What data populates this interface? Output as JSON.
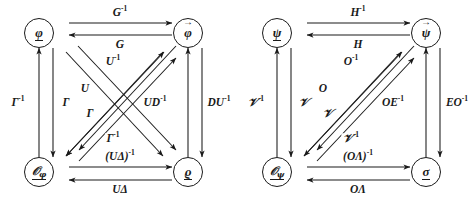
{
  "figure": {
    "type": "commutative-diagram-pair",
    "background": "#ffffff",
    "ink": "#1a1a1a",
    "diagrams": [
      {
        "id": "left",
        "nodes": {
          "top_left": {
            "label": "φ",
            "decoration": "underline"
          },
          "top_right": {
            "label": "φ",
            "decoration": "vector-arrow"
          },
          "bottom_left": {
            "label": "𝒪",
            "subscript": "φ",
            "decoration": "underline"
          },
          "bottom_right": {
            "label": "ϱ",
            "decoration": "underline"
          }
        },
        "edges": [
          {
            "name": "top-forward",
            "from": "top_left",
            "to": "top_right",
            "label": "G",
            "exponent": "-1"
          },
          {
            "name": "top-backward",
            "from": "top_right",
            "to": "top_left",
            "label": "G",
            "exponent": ""
          },
          {
            "name": "left-outer-up",
            "from": "bottom_left",
            "to": "top_left",
            "label": "Γ",
            "exponent": "-1"
          },
          {
            "name": "left-inner-down",
            "from": "top_left",
            "to": "bottom_left",
            "label": "Γ",
            "exponent": ""
          },
          {
            "name": "right-inner-up",
            "from": "bottom_right",
            "to": "top_right",
            "label": "UD",
            "exponent": "-1"
          },
          {
            "name": "right-outer-down",
            "from": "top_right",
            "to": "bottom_right",
            "label": "DU",
            "exponent": "-1"
          },
          {
            "name": "bottom-forward",
            "from": "bottom_left",
            "to": "bottom_right",
            "label": "(UΔ)",
            "exponent": "-1"
          },
          {
            "name": "bottom-backward",
            "from": "bottom_right",
            "to": "bottom_left",
            "label": "UΔ",
            "exponent": ""
          },
          {
            "name": "diagonal-up-right-a",
            "from": "bottom_left",
            "to": "top_right",
            "label": "U",
            "exponent": "-1"
          },
          {
            "name": "diagonal-up-right-b",
            "from": "bottom_left",
            "to": "top_right",
            "label": "U",
            "exponent": ""
          },
          {
            "name": "diagonal-down-left-a",
            "from": "top_right",
            "to": "bottom_left",
            "label": "Γ",
            "exponent": ""
          },
          {
            "name": "diagonal-down-left-b",
            "from": "top_right",
            "to": "bottom_left",
            "label": "Γ",
            "exponent": "-1"
          }
        ],
        "labels": {
          "top_upper": {
            "base": "G",
            "exp": "-1"
          },
          "top_lower": {
            "base": "G",
            "exp": ""
          },
          "left_outer": {
            "base": "Γ",
            "exp": "-1"
          },
          "left_inner": {
            "base": "Γ",
            "exp": ""
          },
          "right_inner": {
            "base": "UD",
            "exp": "-1"
          },
          "right_outer": {
            "base": "DU",
            "exp": "-1"
          },
          "diag_upper": {
            "base": "U",
            "exp": "-1"
          },
          "diag_mid_up": {
            "base": "U",
            "exp": ""
          },
          "diag_mid_low": {
            "base": "Γ",
            "exp": ""
          },
          "diag_lower": {
            "base": "Γ",
            "exp": "-1"
          },
          "bottom_upper": {
            "base": "(UΔ)",
            "exp": "-1"
          },
          "bottom_lower": {
            "base": "UΔ",
            "exp": ""
          }
        }
      },
      {
        "id": "right",
        "nodes": {
          "top_left": {
            "label": "ψ",
            "decoration": "underline"
          },
          "top_right": {
            "label": "ψ",
            "decoration": "vector-arrow"
          },
          "bottom_left": {
            "label": "𝒪",
            "subscript": "ψ",
            "decoration": "underline"
          },
          "bottom_right": {
            "label": "σ",
            "decoration": "underline"
          }
        },
        "edges": [
          {
            "name": "top-forward",
            "from": "top_left",
            "to": "top_right",
            "label": "H",
            "exponent": "-1"
          },
          {
            "name": "top-backward",
            "from": "top_right",
            "to": "top_left",
            "label": "H",
            "exponent": ""
          },
          {
            "name": "left-outer-up",
            "from": "bottom_left",
            "to": "top_left",
            "label": "𝒱",
            "exponent": "-1"
          },
          {
            "name": "left-inner-down",
            "from": "top_left",
            "to": "bottom_left",
            "label": "𝒱",
            "exponent": ""
          },
          {
            "name": "right-inner-up",
            "from": "bottom_right",
            "to": "top_right",
            "label": "OE",
            "exponent": "-1"
          },
          {
            "name": "right-outer-down",
            "from": "top_right",
            "to": "bottom_right",
            "label": "EO",
            "exponent": "-1"
          },
          {
            "name": "bottom-forward",
            "from": "bottom_left",
            "to": "bottom_right",
            "label": "(OΛ)",
            "exponent": "-1"
          },
          {
            "name": "bottom-backward",
            "from": "bottom_right",
            "to": "bottom_left",
            "label": "OΛ",
            "exponent": ""
          },
          {
            "name": "diagonal-up-right-a",
            "from": "bottom_left",
            "to": "top_right",
            "label": "O",
            "exponent": "-1"
          },
          {
            "name": "diagonal-up-right-b",
            "from": "bottom_left",
            "to": "top_right",
            "label": "O",
            "exponent": ""
          },
          {
            "name": "diagonal-down-left-a",
            "from": "top_right",
            "to": "bottom_left",
            "label": "𝒱",
            "exponent": ""
          },
          {
            "name": "diagonal-down-left-b",
            "from": "top_right",
            "to": "bottom_left",
            "label": "𝒱",
            "exponent": "-1"
          }
        ],
        "labels": {
          "top_upper": {
            "base": "H",
            "exp": "-1"
          },
          "top_lower": {
            "base": "H",
            "exp": ""
          },
          "left_outer": {
            "base": "𝒱",
            "exp": "-1"
          },
          "left_inner": {
            "base": "𝒱",
            "exp": ""
          },
          "right_inner": {
            "base": "OE",
            "exp": "-1"
          },
          "right_outer": {
            "base": "EO",
            "exp": "-1"
          },
          "diag_upper": {
            "base": "O",
            "exp": "-1"
          },
          "diag_mid_up": {
            "base": "O",
            "exp": ""
          },
          "diag_mid_low": {
            "base": "𝒱",
            "exp": ""
          },
          "diag_lower": {
            "base": "𝒱",
            "exp": "-1"
          },
          "bottom_upper": {
            "base": "(OΛ)",
            "exp": "-1"
          },
          "bottom_lower": {
            "base": "OΛ",
            "exp": ""
          }
        }
      }
    ]
  }
}
